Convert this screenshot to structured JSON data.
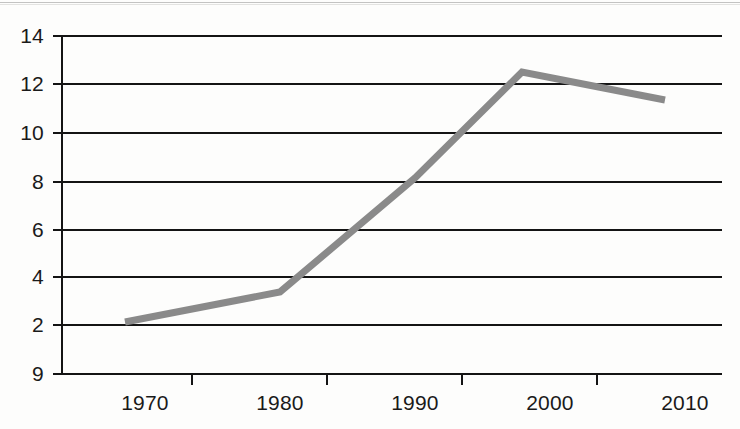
{
  "chart_data": {
    "type": "line",
    "title": "",
    "subtitle": "",
    "xlabel": "",
    "ylabel": "",
    "x": [
      1970,
      1980,
      1990,
      2000,
      2010
    ],
    "categories": [
      "1970",
      "1980",
      "1990",
      "2000",
      "2010"
    ],
    "series": [
      {
        "name": "",
        "values": [
          2.1,
          3.35,
          8.1,
          12.5,
          11.4
        ],
        "color": "#8a8a8a",
        "line_width": 7
      }
    ],
    "xtick_labels": [
      "1970",
      "1980",
      "1990",
      "2000",
      "2010"
    ],
    "ytick_labels": [
      "14",
      "12",
      "10",
      "8",
      "6",
      "4",
      "2",
      "9"
    ],
    "ytick_values": [
      14,
      12,
      10,
      8,
      6,
      4,
      2,
      0
    ],
    "ylim": [
      0,
      14
    ],
    "xlim": [
      1965,
      2015
    ],
    "grid": "horizontal",
    "legend": "none",
    "annotations": []
  },
  "style": {
    "background": "#fdfdfc",
    "grid_color": "#141414",
    "axis_color": "#141414",
    "line_color": "#8a8a8a",
    "text_color": "#1a1a1a"
  },
  "geometry": {
    "axis_x": 62,
    "grid_right": 722,
    "grid_y": [
      36,
      84,
      133,
      182,
      230,
      277,
      325,
      374
    ],
    "xtick_marks_x": [
      192,
      327,
      462,
      597
    ],
    "xlabel_centers_x": [
      145,
      280,
      415,
      550,
      685
    ],
    "point_px": [
      {
        "x": 125,
        "y": 322
      },
      {
        "x": 280,
        "y": 292
      },
      {
        "x": 415,
        "y": 178
      },
      {
        "x": 522,
        "y": 72
      },
      {
        "x": 665,
        "y": 100
      }
    ]
  }
}
